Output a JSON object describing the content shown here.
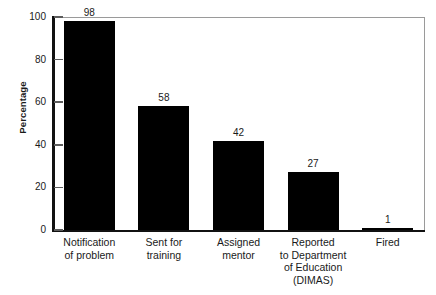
{
  "chart_data": {
    "type": "bar",
    "title": "",
    "subtitle": "",
    "xlabel": "",
    "ylabel": "Percentage",
    "ylim": [
      0,
      100
    ],
    "yticks": [
      0,
      20,
      40,
      60,
      80,
      100
    ],
    "ytick_labels": [
      "0",
      "20",
      "40",
      "60",
      "80",
      "100"
    ],
    "grid": false,
    "legend": null,
    "bar_color": "#000000",
    "axis_color": "#111111",
    "frame_color": "#9a9a9a",
    "categories": [
      "Notification of problem",
      "Sent for training",
      "Assigned mentor",
      "Reported to Department of Education (DIMAS)",
      "Fired"
    ],
    "category_lines": [
      [
        "Notification",
        "of problem"
      ],
      [
        "Sent for",
        "training"
      ],
      [
        "Assigned",
        "mentor"
      ],
      [
        "Reported",
        "to Department",
        "of Education",
        "(DIMAS)"
      ],
      [
        "Fired"
      ]
    ],
    "values": [
      98,
      58,
      42,
      27,
      1
    ],
    "value_labels": [
      "98",
      "58",
      "42",
      "27",
      "1"
    ]
  }
}
